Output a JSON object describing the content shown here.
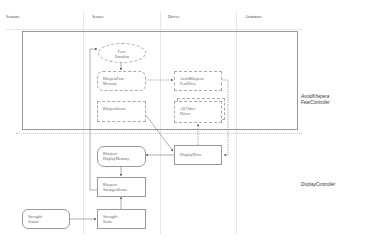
{
  "columns": [
    "Sensors",
    "Senses",
    "Drives",
    "Actuators"
  ],
  "controllers": {
    "top": {
      "line1": "AvoidKhepera",
      "line2": "FearController"
    },
    "bottom": "DisplayController"
  },
  "nodes": {
    "fear_emotion": {
      "line1": "Fear-",
      "line2": "Emotion"
    },
    "khepera_fear_memory": {
      "line1": "KheperaFear-",
      "line2": "Memory"
    },
    "avoid_khepera_fear_drive": {
      "line1": "AvoidKhepera-",
      "line2": "FearDrive"
    },
    "khepera_sense": {
      "line1": "KheperaSense",
      "line2": ""
    },
    "all_other_drives": {
      "line1": "All Other",
      "line2": "Drives"
    },
    "display_drive": {
      "line1": "DisplayDrive",
      "line2": ""
    },
    "khepera_display_memory": {
      "line1": "Khepera-",
      "line2": "DisplayMemory"
    },
    "khepera_strongest_sense": {
      "line1": "Khepera-",
      "line2": "StrongestSense"
    },
    "strength_sensor": {
      "line1": "Strength-",
      "line2": "Sensor"
    },
    "strength_sense": {
      "line1": "Strength-",
      "line2": "Sense"
    }
  },
  "colors": {
    "line": "#888888",
    "frame": "#999999",
    "background": "#ffffff"
  }
}
